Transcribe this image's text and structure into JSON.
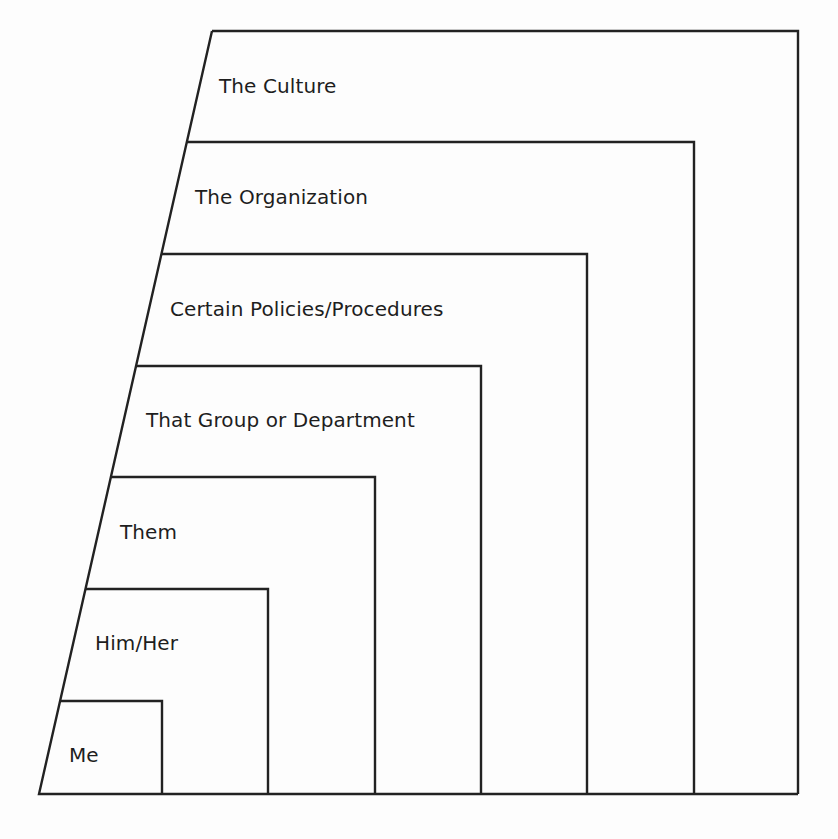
{
  "diagram": {
    "type": "nested-levels",
    "levels": [
      {
        "label": "The Culture",
        "top": 31,
        "right": 798,
        "label_x": 219,
        "label_y": 74
      },
      {
        "label": "The Organization",
        "top": 142,
        "right": 694,
        "label_x": 195,
        "label_y": 185
      },
      {
        "label": "Certain Policies/Procedures",
        "top": 254,
        "right": 587,
        "label_x": 170,
        "label_y": 297
      },
      {
        "label": "That Group or Department",
        "top": 366,
        "right": 481,
        "label_x": 146,
        "label_y": 408
      },
      {
        "label": "Them",
        "top": 477,
        "right": 375,
        "label_x": 120,
        "label_y": 520
      },
      {
        "label": "Him/Her",
        "top": 589,
        "right": 268,
        "label_x": 95,
        "label_y": 631
      },
      {
        "label": "Me",
        "top": 701,
        "right": 162,
        "label_x": 69,
        "label_y": 743
      }
    ],
    "bottom": 794,
    "slant_top": [
      212,
      31
    ],
    "slant_bottom": [
      39,
      794
    ],
    "line_color": "#222222",
    "background": "#fdfdfd"
  }
}
